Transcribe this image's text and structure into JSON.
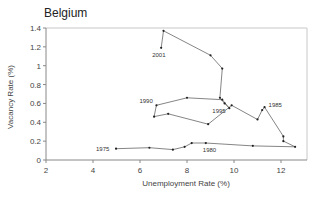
{
  "chart_data": {
    "type": "line",
    "title": "Belgium",
    "xlabel": "Unemployment Rate (%)",
    "ylabel": "Vacancy Rate (%)",
    "xlim": [
      2,
      13
    ],
    "ylim": [
      0,
      1.4
    ],
    "xticks": [
      2,
      4,
      6,
      8,
      10,
      12
    ],
    "yticks": [
      0,
      0.2,
      0.4,
      0.6,
      0.8,
      1.0,
      1.2,
      1.4
    ],
    "ytick_labels": [
      "0",
      "0.2",
      "0.4",
      "0.6",
      "0.8",
      "1",
      "1.2",
      "1.4"
    ],
    "grid": false,
    "legend": null,
    "series": [
      {
        "name": "Beveridge curve 1975-2001",
        "points": [
          [
            4.98,
            0.12
          ],
          [
            6.4,
            0.13
          ],
          [
            7.4,
            0.11
          ],
          [
            7.9,
            0.14
          ],
          [
            8.2,
            0.18
          ],
          [
            8.8,
            0.18
          ],
          [
            10.8,
            0.15
          ],
          [
            12.6,
            0.14
          ],
          [
            12.1,
            0.2
          ],
          [
            12.1,
            0.25
          ],
          [
            11.3,
            0.56
          ],
          [
            11.2,
            0.53
          ],
          [
            11.0,
            0.43
          ],
          [
            9.9,
            0.58
          ],
          [
            8.9,
            0.38
          ],
          [
            7.2,
            0.49
          ],
          [
            6.6,
            0.46
          ],
          [
            6.7,
            0.58
          ],
          [
            8.0,
            0.66
          ],
          [
            9.5,
            0.64
          ],
          [
            9.8,
            0.55
          ],
          [
            9.6,
            0.6
          ],
          [
            9.4,
            0.66
          ],
          [
            9.5,
            0.97
          ],
          [
            9.0,
            1.11
          ],
          [
            7.0,
            1.37
          ],
          [
            6.9,
            1.19
          ]
        ]
      }
    ],
    "annotations": [
      {
        "text": "1975",
        "x": 4.98,
        "y": 0.12
      },
      {
        "text": "1980",
        "x": 8.8,
        "y": 0.18
      },
      {
        "text": "1985",
        "x": 11.3,
        "y": 0.56
      },
      {
        "text": "1990",
        "x": 6.7,
        "y": 0.58
      },
      {
        "text": "1995",
        "x": 9.8,
        "y": 0.55
      },
      {
        "text": "2001",
        "x": 6.9,
        "y": 1.19
      }
    ]
  }
}
